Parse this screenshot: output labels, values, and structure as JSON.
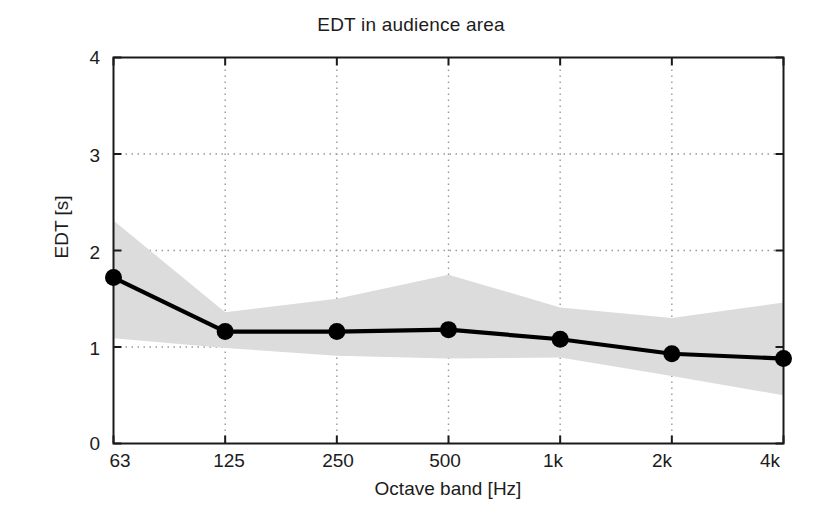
{
  "chart_data": {
    "type": "line",
    "title": "EDT in audience area",
    "xlabel": "Octave band [Hz]",
    "ylabel": "EDT [s]",
    "categories": [
      "63",
      "125",
      "250",
      "500",
      "1k",
      "2k",
      "4k"
    ],
    "xtick_labels": [
      "63",
      "125",
      "250",
      "500",
      "1k",
      "2k",
      "4k"
    ],
    "ytick_labels": [
      "0",
      "1",
      "2",
      "3",
      "4"
    ],
    "ytick_values": [
      0,
      1,
      2,
      3,
      4
    ],
    "ylim": [
      0,
      4
    ],
    "grid": "dotted",
    "legend": "none",
    "series": [
      {
        "name": "EDT mean",
        "values": [
          1.72,
          1.16,
          1.16,
          1.18,
          1.08,
          0.93,
          0.88
        ],
        "marker": "filled-circle",
        "color": "#000000"
      },
      {
        "name": "EDT spread upper",
        "values": [
          2.31,
          1.36,
          1.5,
          1.75,
          1.41,
          1.3,
          1.46
        ],
        "color": "#d9d9d9"
      },
      {
        "name": "EDT spread lower",
        "values": [
          1.09,
          0.99,
          0.91,
          0.88,
          0.89,
          0.7,
          0.5
        ],
        "color": "#d9d9d9"
      }
    ],
    "band_fill_color": "#dcdcdc",
    "axis_color": "#1a1a1a",
    "gridline_color": "#999999",
    "background_color": "#ffffff"
  }
}
